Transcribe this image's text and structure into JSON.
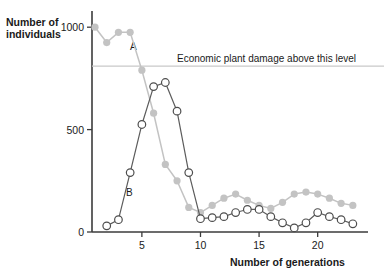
{
  "chart_data": {
    "type": "line",
    "title": "",
    "xlabel": "Number of generations",
    "ylabel": "Number of individuals",
    "xlim": [
      0.2,
      23.8
    ],
    "ylim": [
      0,
      1060
    ],
    "xticks": [
      5,
      10,
      15,
      20
    ],
    "yticks": [
      0,
      500,
      1000
    ],
    "grid": false,
    "legend": "inline-curve-labels",
    "annotations": [
      {
        "name": "economic-threshold",
        "text": "Economic plant damage above this level",
        "type": "hline",
        "y": 810,
        "x_text": 14.5
      },
      {
        "name": "curve-a-label",
        "text": "A",
        "x": 4.1,
        "y": 880
      },
      {
        "name": "curve-b-label",
        "text": "B",
        "x": 5.4,
        "y": 195
      }
    ],
    "series": [
      {
        "name": "A",
        "label": "A",
        "marker": "filled-circle",
        "color": "#c3c3c3",
        "x": [
          1,
          2,
          3,
          4,
          5,
          6,
          7,
          8,
          9,
          10,
          11,
          12,
          13,
          14,
          15,
          16,
          17,
          18,
          19,
          20,
          21,
          22,
          23
        ],
        "values": [
          1000,
          925,
          975,
          975,
          790,
          580,
          330,
          250,
          120,
          95,
          130,
          165,
          185,
          155,
          130,
          115,
          145,
          185,
          195,
          185,
          165,
          140,
          130
        ]
      },
      {
        "name": "B",
        "label": "B",
        "marker": "open-circle",
        "color": "#4d4d4d",
        "x": [
          2,
          3,
          4,
          5,
          6,
          7,
          8,
          9,
          10,
          11,
          12,
          13,
          14,
          15,
          16,
          17,
          18,
          19,
          20,
          21,
          22,
          23
        ],
        "values": [
          30,
          60,
          290,
          525,
          710,
          730,
          590,
          290,
          65,
          70,
          75,
          95,
          110,
          110,
          75,
          45,
          20,
          45,
          95,
          75,
          60,
          40
        ]
      }
    ]
  },
  "axes": {
    "y_title_line1": "Number of",
    "y_title_line2": "individuals",
    "x_title": "Number of generations",
    "y_tick_labels": [
      "1000",
      "500",
      "0"
    ],
    "x_tick_labels": [
      "5",
      "10",
      "15",
      "20"
    ]
  },
  "annotation_labels": {
    "threshold": "Economic plant damage above this level",
    "curve_a": "A",
    "curve_b": "B"
  }
}
